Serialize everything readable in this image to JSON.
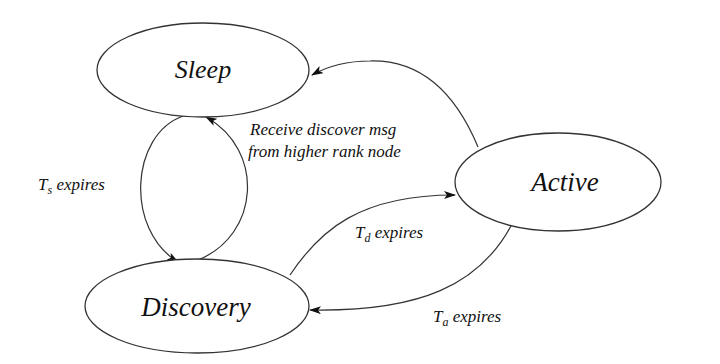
{
  "diagram": {
    "type": "state-machine",
    "nodes": [
      {
        "id": "sleep",
        "label": "Sleep"
      },
      {
        "id": "active",
        "label": "Active"
      },
      {
        "id": "discovery",
        "label": "Discovery"
      }
    ],
    "edges": [
      {
        "id": "sleep-to-discovery",
        "from": "sleep",
        "to": "discovery",
        "label_main": "T",
        "label_sub": "s",
        "label_rest": " expires"
      },
      {
        "id": "discovery-to-sleep",
        "from": "discovery",
        "to": "sleep",
        "label_line1": "Receive discover msg",
        "label_line2": "from higher rank node"
      },
      {
        "id": "active-to-sleep",
        "from": "active",
        "to": "sleep",
        "label": ""
      },
      {
        "id": "discovery-to-active",
        "from": "discovery",
        "to": "active",
        "label_main": "T",
        "label_sub": "d",
        "label_rest": " expires"
      },
      {
        "id": "active-to-discovery",
        "from": "active",
        "to": "discovery",
        "label_main": "T",
        "label_sub": "a",
        "label_rest": " expires"
      }
    ],
    "colors": {
      "stroke": "#333333",
      "text": "#111111",
      "background": "#ffffff"
    }
  }
}
